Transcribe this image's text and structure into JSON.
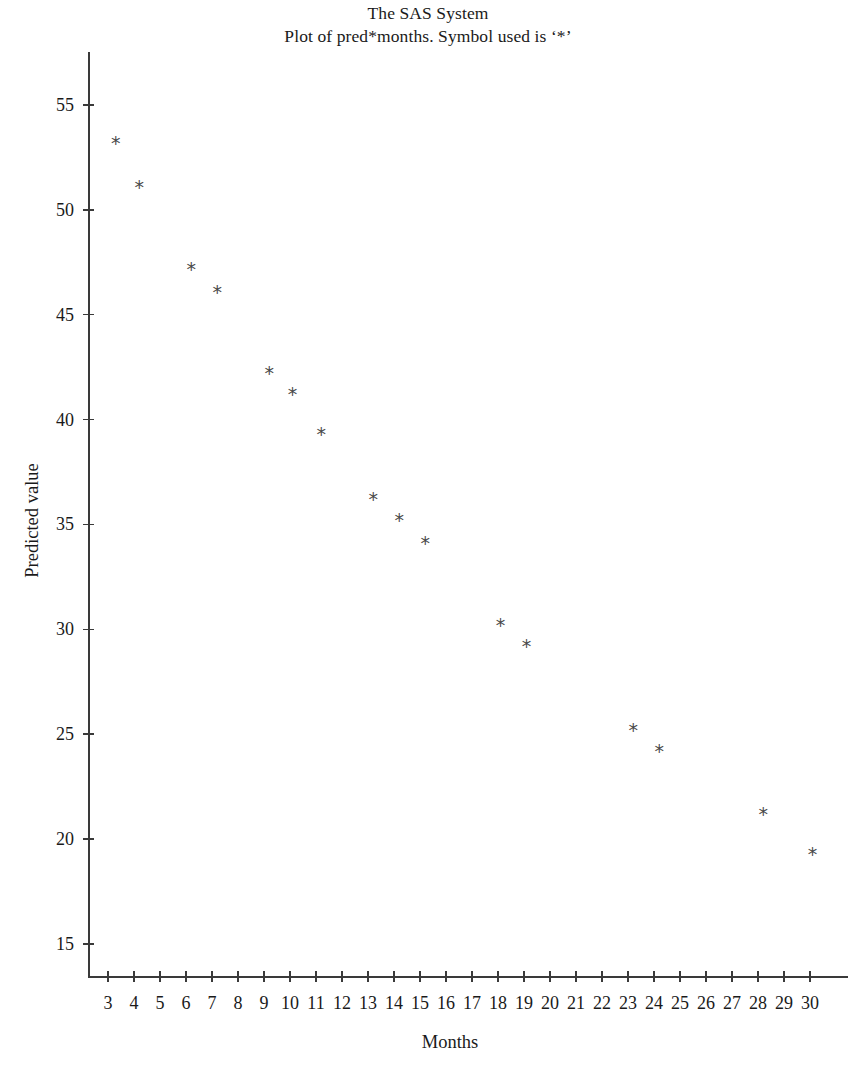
{
  "titles": {
    "line1": "The SAS System",
    "line2": "Plot of pred*months. Symbol used is ‘*’"
  },
  "axes": {
    "x_title": "Months",
    "y_title": "Predicted value"
  },
  "chart_data": {
    "type": "scatter",
    "title": "The SAS System",
    "subtitle": "Plot of pred*months. Symbol used is ‘*’",
    "xlabel": "Months",
    "ylabel": "Predicted value",
    "marker_symbol": "*",
    "marker_color": "#4a4a4a",
    "grid": false,
    "legend": false,
    "xlim": [
      2.3,
      30.5
    ],
    "ylim": [
      13.2,
      56.8
    ],
    "xticks": [
      3,
      4,
      5,
      6,
      7,
      8,
      9,
      10,
      11,
      12,
      13,
      14,
      15,
      16,
      17,
      18,
      19,
      20,
      21,
      22,
      23,
      24,
      25,
      26,
      27,
      28,
      29,
      30
    ],
    "yticks": [
      15,
      20,
      25,
      30,
      35,
      40,
      45,
      50,
      55
    ],
    "xtick_labels": [
      "3",
      "4",
      "5",
      "6",
      "7",
      "8",
      "9",
      "10",
      "11",
      "12",
      "13",
      "14",
      "15",
      "16",
      "17",
      "18",
      "19",
      "20",
      "21",
      "22",
      "23",
      "24",
      "25",
      "26",
      "27",
      "28",
      "29",
      "30"
    ],
    "ytick_labels": [
      "15",
      "20",
      "25",
      "30",
      "35",
      "40",
      "45",
      "50",
      "55"
    ],
    "points": [
      {
        "x": 3.3,
        "y": 53.2
      },
      {
        "x": 4.2,
        "y": 51.1
      },
      {
        "x": 6.2,
        "y": 47.2
      },
      {
        "x": 7.2,
        "y": 46.1
      },
      {
        "x": 9.2,
        "y": 42.2
      },
      {
        "x": 10.1,
        "y": 41.2
      },
      {
        "x": 11.2,
        "y": 39.3
      },
      {
        "x": 13.2,
        "y": 36.2
      },
      {
        "x": 14.2,
        "y": 35.2
      },
      {
        "x": 15.2,
        "y": 34.1
      },
      {
        "x": 18.1,
        "y": 30.2
      },
      {
        "x": 19.1,
        "y": 29.2
      },
      {
        "x": 23.2,
        "y": 25.2
      },
      {
        "x": 24.2,
        "y": 24.2
      },
      {
        "x": 28.2,
        "y": 21.2
      },
      {
        "x": 30.1,
        "y": 19.3
      }
    ]
  }
}
